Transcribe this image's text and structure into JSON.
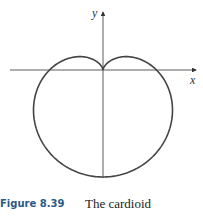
{
  "figure": {
    "number": "Figure 8.39",
    "caption": "The cardioid",
    "x_label": "x",
    "y_label": "y",
    "curve_color": "#444444",
    "axis_color": "#333333",
    "caption_number_color": "#2a5a8a"
  }
}
